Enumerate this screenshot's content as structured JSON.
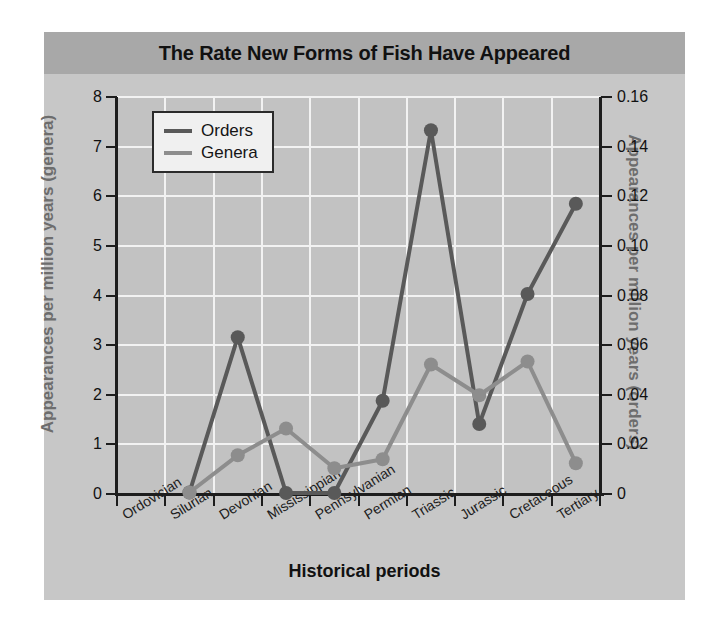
{
  "title": "The Rate New Forms of Fish Have Appeared",
  "axis_titles": {
    "left": "Appearances per million years (genera)",
    "right": "Appearances per million years (orders)",
    "bottom": "Historical periods"
  },
  "legend": {
    "items": [
      {
        "label": "Orders",
        "color": "#595959"
      },
      {
        "label": "Genera",
        "color": "#8d8d8d"
      }
    ]
  },
  "colors": {
    "orders": "#595959",
    "genera": "#8d8d8d",
    "figure_bg": "#c7c7c7",
    "plot_bg": "#c2c2c2",
    "title_band": "#a8a8a8",
    "grid": "#f2f2f2",
    "axis": "#1d1d1d",
    "axis_title": "#6d6d6d"
  },
  "left_axis_ticks": [
    "0",
    "1",
    "2",
    "3",
    "4",
    "5",
    "6",
    "7",
    "8"
  ],
  "right_axis_ticks": [
    "0",
    "0.02",
    "0.04",
    "0.06",
    "0.08",
    "0.10",
    "0.12",
    "0.14",
    "0.16"
  ],
  "chart_data": {
    "type": "line",
    "title": "The Rate New Forms of Fish Have Appeared",
    "xlabel": "Historical periods",
    "ylabel": "Appearances per million years (genera)",
    "ylabel_secondary": "Appearances per million years (orders)",
    "categories": [
      "Ordovician",
      "Silurian",
      "Devonian",
      "Mississippian",
      "Pennsylvanian",
      "Permian",
      "Triassic",
      "Jurassic",
      "Cretaceous",
      "Tertiary"
    ],
    "ylim": [
      0,
      8
    ],
    "ylim_secondary": [
      0,
      0.16
    ],
    "yticks": [
      0,
      1,
      2,
      3,
      4,
      5,
      6,
      7,
      8
    ],
    "yticks_secondary": [
      0,
      0.02,
      0.04,
      0.06,
      0.08,
      0.1,
      0.12,
      0.14,
      0.16
    ],
    "grid": true,
    "legend_position": "upper left",
    "series": [
      {
        "name": "Orders",
        "axis": "secondary",
        "color": "#595959",
        "values_left_scale": [
          null,
          0.03,
          3.16,
          0.02,
          0.02,
          1.88,
          7.33,
          1.41,
          4.03,
          5.85
        ],
        "values": [
          null,
          0.0006,
          0.0632,
          0.0004,
          0.0004,
          0.0376,
          0.1466,
          0.0282,
          0.0806,
          0.117
        ]
      },
      {
        "name": "Genera",
        "axis": "primary",
        "color": "#8d8d8d",
        "values": [
          null,
          0.03,
          0.78,
          1.32,
          0.52,
          0.7,
          2.61,
          1.99,
          2.67,
          0.62
        ]
      }
    ]
  }
}
